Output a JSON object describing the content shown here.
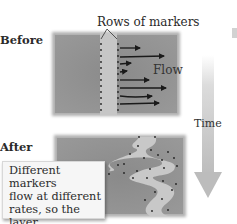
{
  "labels": {
    "rows_of_markers": "Rows of markers",
    "before": "Before",
    "flow": "Flow",
    "time": "Time",
    "after": "After"
  },
  "callout": {
    "lines": [
      "Different markers",
      "flow at different",
      "rates, so the layer",
      "becomes folded."
    ]
  },
  "colors": {
    "background_panel": "#8c8c8c",
    "light_layer": "#c4c4c4",
    "arrow": "#1a1a1a",
    "marker": "#222222",
    "time_arrow": "#c8c8c8",
    "callout_bg": "#f6f6f6"
  }
}
